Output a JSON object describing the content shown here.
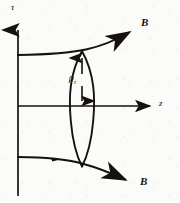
{
  "figure": {
    "name": "magnetic-field-line-diagram",
    "background_color": "#fbfbf9",
    "ink_color": "#15110f",
    "width": 180,
    "height": 203
  },
  "axes": {
    "vertical": {
      "label": "τ",
      "icon": "axis-arrow-up",
      "x": 18,
      "y_top": 18,
      "y_bottom": 196,
      "label_x": 11,
      "label_y": 4
    },
    "horizontal": {
      "label": "z",
      "icon": "axis-arrow-right",
      "y": 106,
      "x_left": 18,
      "x_right": 155,
      "label_x": 160,
      "label_y": 101
    },
    "origin": {
      "x": 18,
      "y": 106
    }
  },
  "field_lines": [
    {
      "id": "upper-field-line",
      "label": "B",
      "icon": "arrowhead-up-right",
      "description": "upper magnetic field line curving up to the right",
      "path": "M 18 55 C 48 54.5 70 53 86 49.5 C 104 45.5 118 39 132 31",
      "arrow_tip": {
        "x": 136,
        "y": 28.5
      },
      "label_x": 142,
      "label_y": 23
    },
    {
      "id": "lower-field-line",
      "label": "B",
      "icon": "arrowhead-down-right",
      "description": "lower magnetic field line curving down to the right",
      "path": "M 18 157 C 46 157.2 66 159 82 163.5 C 100 168.5 114 174.5 128 181",
      "arrow_tip": {
        "x": 134,
        "y": 184
      },
      "label_x": 141,
      "label_y": 182,
      "mid_tick": {
        "x": 56,
        "y": 159
      }
    }
  ],
  "flux_tube": {
    "id": "flux-tube-lens",
    "description": "vertical lens shape spanning between the two field lines",
    "top": {
      "x": 82,
      "y": 51
    },
    "bottom": {
      "x": 82,
      "y": 166
    },
    "left_path": "M 82 51 C 70 74 69 96 71 120 C 73 142 78 157 82 166",
    "right_path": "M 82 51 C 94 74 95 96 93 120 C 91 142 86 157 82 166",
    "measure": {
      "label": "ρ",
      "subscript": "τ",
      "icon": "double-headed-arrow-vertical",
      "x": 82,
      "y_top": 56,
      "y_bottom": 101,
      "label_x": 70,
      "label_y": 73
    }
  }
}
